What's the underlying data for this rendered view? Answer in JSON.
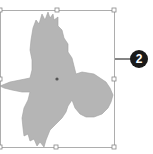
{
  "figure": {
    "shape_fill": "#b4b4b4",
    "shape_stroke": "#9a9a9a",
    "selection": {
      "box_color": "#9a9a9a",
      "handle_count": 8,
      "center_marker": true
    },
    "callout": {
      "number": "2",
      "badge_color": "#1a1a1a",
      "text_color": "#ffffff",
      "line_color": "#333333"
    }
  }
}
